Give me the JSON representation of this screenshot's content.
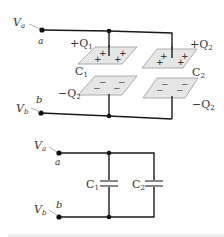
{
  "figure": {
    "top_diagram": {
      "node_a": {
        "potential_label": "V",
        "potential_sub": "a",
        "node_label": "a"
      },
      "node_b": {
        "potential_label": "V",
        "potential_sub": "b",
        "node_label": "b"
      },
      "capacitor_1": {
        "label": "C",
        "sub": "1",
        "top_charge": "+Q",
        "top_charge_sub": "1",
        "bottom_charge": "−Q",
        "bottom_charge_sub": "2",
        "top_signs": "+",
        "bottom_signs": "−"
      },
      "capacitor_2": {
        "label": "C",
        "sub": "2",
        "top_charge": "+Q",
        "top_charge_sub": "2",
        "bottom_charge": "−Q",
        "bottom_charge_sub": "2",
        "top_signs": "+",
        "bottom_signs": "−"
      }
    },
    "bottom_diagram": {
      "node_a": {
        "potential_label": "V",
        "potential_sub": "a",
        "node_label": "a"
      },
      "node_b": {
        "potential_label": "V",
        "potential_sub": "b",
        "node_label": "b"
      },
      "capacitor_1": {
        "label": "C",
        "sub": "1"
      },
      "capacitor_2": {
        "label": "C",
        "sub": "2"
      }
    },
    "colors": {
      "wire": "#1a1a1a",
      "plate_fill": "#e6e6e6",
      "plate_edge": "#9a9a9a",
      "capacitor_symbol": "#888888",
      "footer_bar": "#eeeeee"
    }
  }
}
